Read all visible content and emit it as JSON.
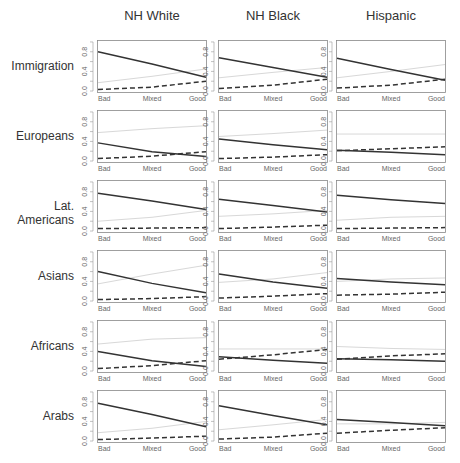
{
  "columns": [
    "NH White",
    "NH Black",
    "Hispanic"
  ],
  "rows": [
    "Immigration",
    "Europeans",
    "Lat. Americans",
    "Asians",
    "Africans",
    "Arabs"
  ],
  "x_ticks": [
    "Bad",
    "Mixed",
    "Good"
  ],
  "y_ticks": [
    "0.0",
    "0.4",
    "0.8"
  ],
  "colors": {
    "solid": "#333333",
    "dashed": "#333333",
    "gray": "#d8d8d8",
    "frame": "#888888"
  },
  "chart_data": {
    "type": "line",
    "title": "",
    "layout": "small multiples, 6 rows x 3 columns",
    "col_labels": [
      "NH White",
      "NH Black",
      "Hispanic"
    ],
    "row_labels": [
      "Immigration",
      "Europeans",
      "Lat. Americans",
      "Asians",
      "Africans",
      "Arabs"
    ],
    "x": [
      "Bad",
      "Mixed",
      "Good"
    ],
    "ylim": [
      -0.04,
      1.04
    ],
    "y_ticks": [
      0.0,
      0.4,
      0.8
    ],
    "grid": false,
    "series_names": [
      "solid",
      "dashed",
      "gray"
    ],
    "panels": [
      [
        {
          "solid": [
            0.8,
            0.55,
            0.28
          ],
          "dashed": [
            0.03,
            0.08,
            0.2
          ],
          "gray": [
            0.17,
            0.3,
            0.45
          ]
        },
        {
          "solid": [
            0.68,
            0.48,
            0.28
          ],
          "dashed": [
            0.05,
            0.12,
            0.24
          ],
          "gray": [
            0.27,
            0.38,
            0.48
          ]
        },
        {
          "solid": [
            0.67,
            0.44,
            0.22
          ],
          "dashed": [
            0.06,
            0.12,
            0.24
          ],
          "gray": [
            0.27,
            0.4,
            0.54
          ]
        }
      ],
      [
        {
          "solid": [
            0.37,
            0.19,
            0.09
          ],
          "dashed": [
            0.05,
            0.1,
            0.19
          ],
          "gray": [
            0.58,
            0.66,
            0.72
          ]
        },
        {
          "solid": [
            0.45,
            0.33,
            0.23
          ],
          "dashed": [
            0.05,
            0.08,
            0.13
          ],
          "gray": [
            0.5,
            0.56,
            0.63
          ]
        },
        {
          "solid": [
            0.22,
            0.18,
            0.13
          ],
          "dashed": [
            0.21,
            0.25,
            0.29
          ],
          "gray": [
            0.55,
            0.55,
            0.55
          ]
        }
      ],
      [
        {
          "solid": [
            0.77,
            0.61,
            0.44
          ],
          "dashed": [
            0.05,
            0.06,
            0.07
          ],
          "gray": [
            0.2,
            0.28,
            0.42
          ]
        },
        {
          "solid": [
            0.65,
            0.52,
            0.39
          ],
          "dashed": [
            0.05,
            0.08,
            0.12
          ],
          "gray": [
            0.3,
            0.35,
            0.42
          ]
        },
        {
          "solid": [
            0.73,
            0.64,
            0.56
          ],
          "dashed": [
            0.05,
            0.06,
            0.07
          ],
          "gray": [
            0.22,
            0.28,
            0.3
          ]
        }
      ],
      [
        {
          "solid": [
            0.6,
            0.36,
            0.17
          ],
          "dashed": [
            0.03,
            0.05,
            0.09
          ],
          "gray": [
            0.35,
            0.55,
            0.73
          ]
        },
        {
          "solid": [
            0.55,
            0.39,
            0.26
          ],
          "dashed": [
            0.06,
            0.1,
            0.15
          ],
          "gray": [
            0.38,
            0.45,
            0.58
          ]
        },
        {
          "solid": [
            0.46,
            0.39,
            0.33
          ],
          "dashed": [
            0.12,
            0.14,
            0.18
          ],
          "gray": [
            0.4,
            0.45,
            0.47
          ]
        }
      ],
      [
        {
          "solid": [
            0.4,
            0.21,
            0.09
          ],
          "dashed": [
            0.05,
            0.11,
            0.21
          ],
          "gray": [
            0.55,
            0.65,
            0.68
          ]
        },
        {
          "solid": [
            0.29,
            0.22,
            0.16
          ],
          "dashed": [
            0.24,
            0.33,
            0.44
          ],
          "gray": [
            0.45,
            0.45,
            0.45
          ]
        },
        {
          "solid": [
            0.25,
            0.23,
            0.2
          ],
          "dashed": [
            0.24,
            0.31,
            0.35
          ],
          "gray": [
            0.5,
            0.46,
            0.44
          ]
        }
      ],
      [
        {
          "solid": [
            0.77,
            0.54,
            0.29
          ],
          "dashed": [
            0.03,
            0.06,
            0.1
          ],
          "gray": [
            0.17,
            0.26,
            0.4
          ]
        },
        {
          "solid": [
            0.72,
            0.52,
            0.33
          ],
          "dashed": [
            0.04,
            0.08,
            0.16
          ],
          "gray": [
            0.23,
            0.33,
            0.44
          ]
        },
        {
          "solid": [
            0.44,
            0.38,
            0.31
          ],
          "dashed": [
            0.16,
            0.22,
            0.27
          ],
          "gray": [
            0.35,
            0.35,
            0.38
          ]
        }
      ]
    ]
  }
}
